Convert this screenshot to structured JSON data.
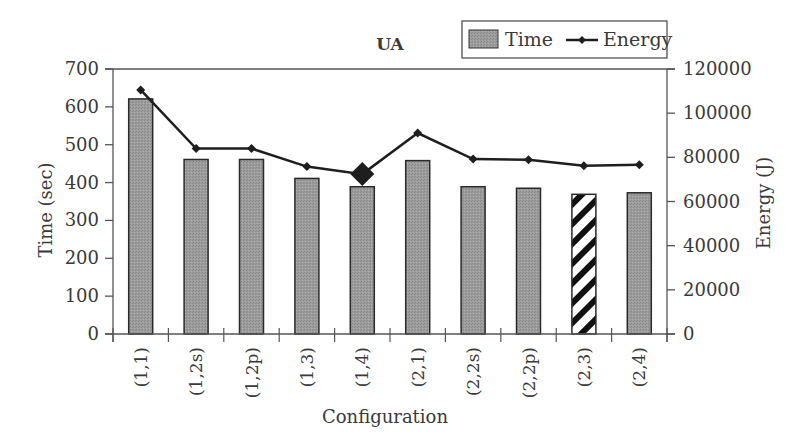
{
  "chart_data": {
    "type": "bar",
    "title": "UA",
    "xlabel": "Configuration",
    "ylabel": "Time (sec)",
    "y2label": "Energy (J)",
    "categories": [
      "(1,1)",
      "(1,2s)",
      "(1,2p)",
      "(1,3)",
      "(1,4)",
      "(2,1)",
      "(2,2s)",
      "(2,2p)",
      "(2,3)",
      "(2,4)"
    ],
    "series": [
      {
        "name": "Time",
        "type": "bar",
        "axis": "left",
        "values": [
          621,
          461,
          461,
          411,
          389,
          458,
          389,
          385,
          369,
          373
        ]
      },
      {
        "name": "Energy",
        "type": "line",
        "axis": "right",
        "values": [
          110500,
          84000,
          84000,
          75800,
          72400,
          91000,
          79200,
          78900,
          76200,
          76600
        ]
      }
    ],
    "ylim": [
      0,
      700
    ],
    "y2lim": [
      0,
      120000
    ],
    "yticks": [
      0,
      100,
      200,
      300,
      400,
      500,
      600,
      700
    ],
    "y2ticks": [
      0,
      20000,
      40000,
      60000,
      80000,
      100000,
      120000
    ],
    "highlights": {
      "min_energy_index": 4,
      "min_time_index": 8
    },
    "legend": {
      "position": "top-right",
      "entries": [
        "Time",
        "Energy"
      ]
    },
    "grid": false
  },
  "colors": {
    "bar_fill": "#9a9a9a",
    "bar_stroke": "#2a2a2a",
    "line": "#1e1e1e",
    "axis": "#555555",
    "text": "#3a3a3a"
  }
}
